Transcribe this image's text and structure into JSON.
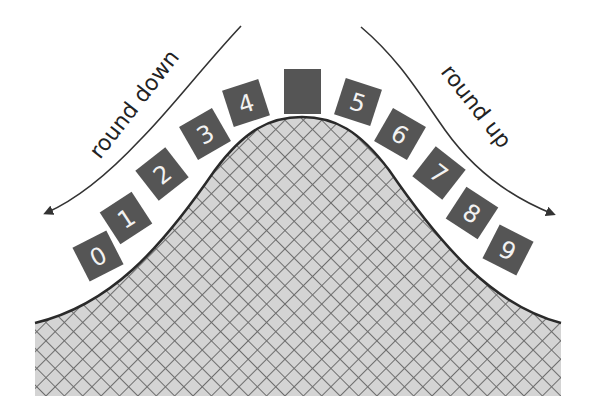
{
  "diagram": {
    "type": "rounding-bell-curve",
    "labels": {
      "left": "round down",
      "right": "round up"
    },
    "center_box_label": "",
    "digits": [
      {
        "label": "0",
        "cx": 98,
        "cy": 256,
        "angle": -27
      },
      {
        "label": "1",
        "cx": 126,
        "cy": 218,
        "angle": -33
      },
      {
        "label": "2",
        "cx": 162,
        "cy": 174,
        "angle": -38
      },
      {
        "label": "3",
        "cx": 205,
        "cy": 134,
        "angle": -30
      },
      {
        "label": "4",
        "cx": 246,
        "cy": 103,
        "angle": -18
      },
      {
        "label": "5",
        "cx": 358,
        "cy": 102,
        "angle": 18
      },
      {
        "label": "6",
        "cx": 400,
        "cy": 134,
        "angle": 30
      },
      {
        "label": "7",
        "cx": 439,
        "cy": 173,
        "angle": 38
      },
      {
        "label": "8",
        "cx": 472,
        "cy": 213,
        "angle": 33
      },
      {
        "label": "9",
        "cx": 508,
        "cy": 250,
        "angle": 27
      }
    ],
    "colors": {
      "box_fill": "#555555",
      "digit_text": "#f2f2f2",
      "curve_stroke": "#2a2a2a",
      "hatch_fill": "#d4d4d4",
      "hatch_line": "#6e6e6e",
      "arrow": "#333333"
    }
  }
}
